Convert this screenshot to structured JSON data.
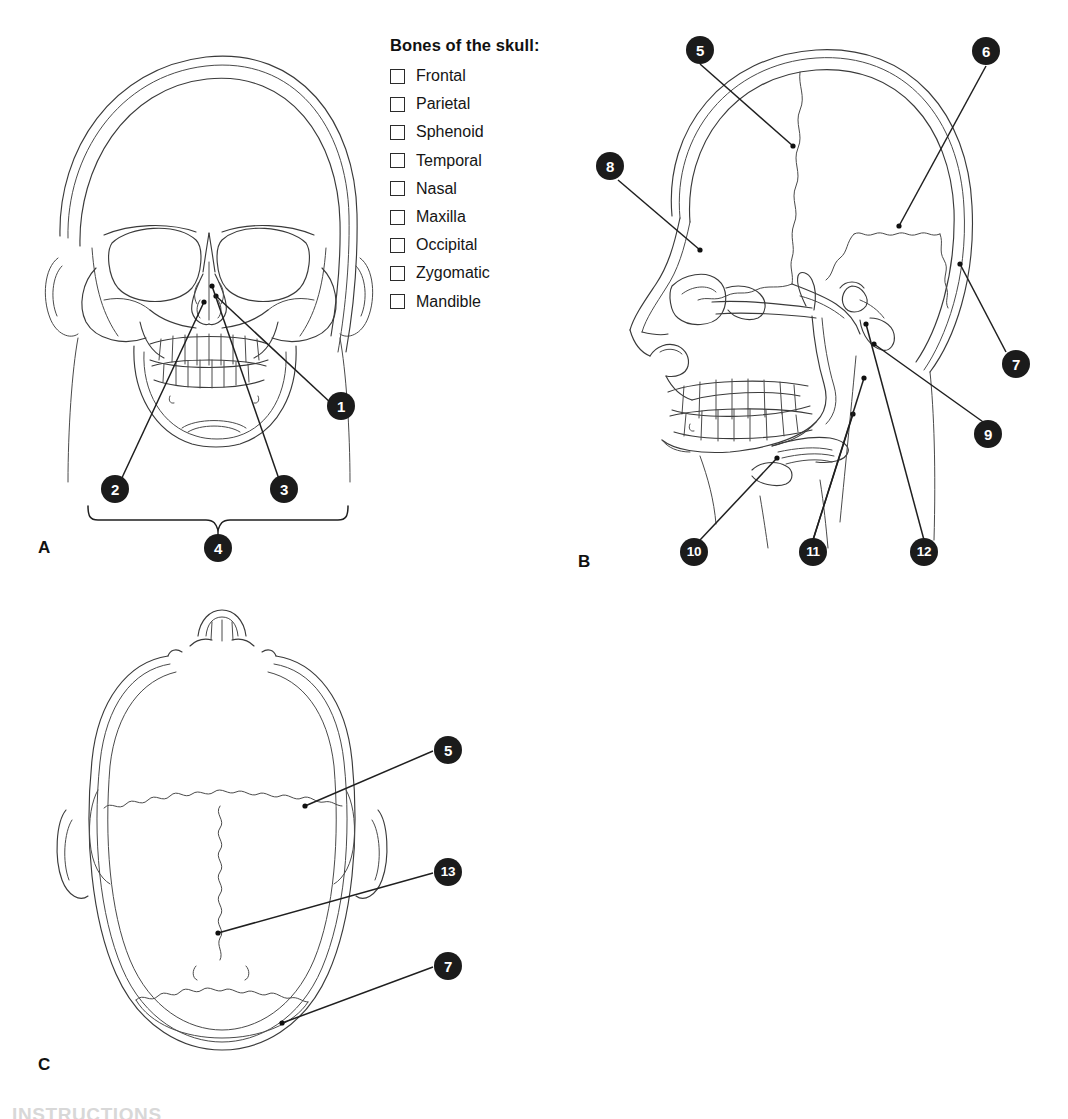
{
  "checklist": {
    "title": "Bones of the skull:",
    "items": [
      {
        "label": "Frontal"
      },
      {
        "label": "Parietal"
      },
      {
        "label": "Sphenoid"
      },
      {
        "label": "Temporal"
      },
      {
        "label": "Nasal"
      },
      {
        "label": "Maxilla"
      },
      {
        "label": "Occipital"
      },
      {
        "label": "Zygomatic"
      },
      {
        "label": "Mandible"
      }
    ]
  },
  "panels": {
    "a": {
      "letter": "A",
      "caption": "anterior view of skull"
    },
    "b": {
      "letter": "B",
      "caption": "lateral view of skull"
    },
    "c": {
      "letter": "C",
      "caption": "superior view of skull"
    }
  },
  "markers": {
    "a": [
      {
        "id": "1",
        "number": "1"
      },
      {
        "id": "2",
        "number": "2"
      },
      {
        "id": "3",
        "number": "3"
      },
      {
        "id": "4",
        "number": "4"
      }
    ],
    "b": [
      {
        "id": "5",
        "number": "5"
      },
      {
        "id": "6",
        "number": "6"
      },
      {
        "id": "7",
        "number": "7"
      },
      {
        "id": "8",
        "number": "8"
      },
      {
        "id": "9",
        "number": "9"
      },
      {
        "id": "10",
        "number": "10"
      },
      {
        "id": "11",
        "number": "11"
      },
      {
        "id": "12",
        "number": "12"
      }
    ],
    "c": [
      {
        "id": "c5",
        "number": "5"
      },
      {
        "id": "c13",
        "number": "13"
      },
      {
        "id": "c7",
        "number": "7"
      }
    ]
  },
  "footer": {
    "instructions_label": "INSTRUCTIONS"
  },
  "colors": {
    "marker_fill": "#1b1b1b",
    "marker_text": "#ffffff",
    "line_art": "#3a3a3a",
    "leader_line": "#1f1f1f",
    "background": "#ffffff"
  }
}
